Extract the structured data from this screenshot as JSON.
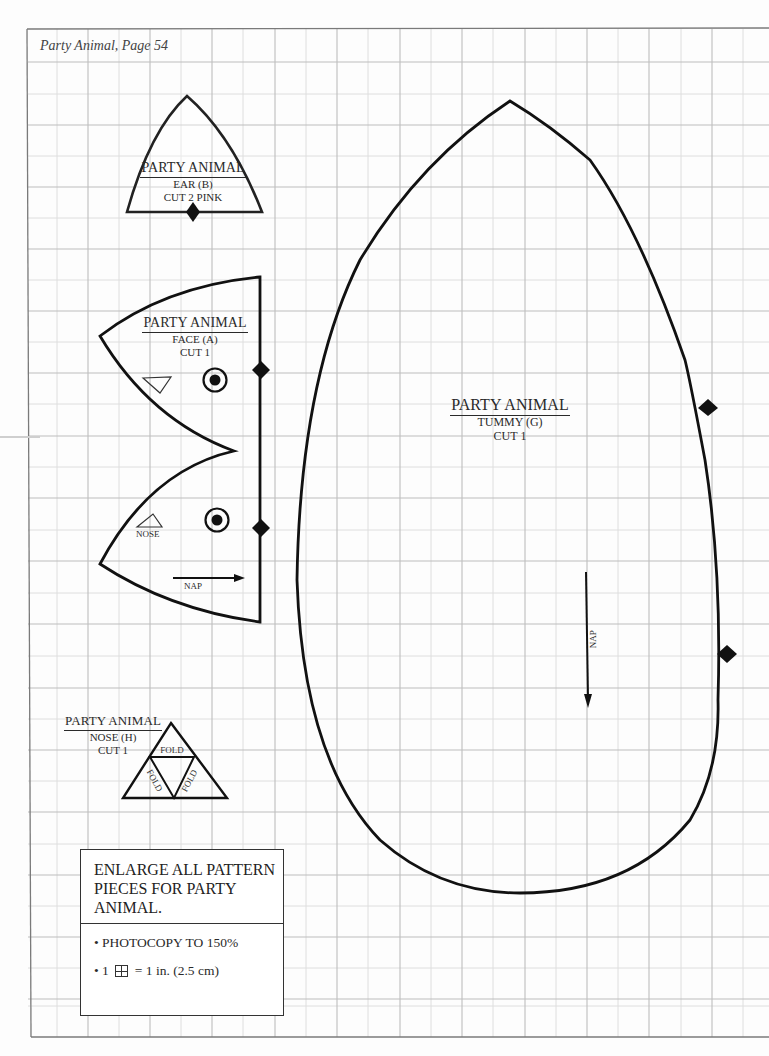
{
  "header": {
    "title": "Party Animal, Page 54"
  },
  "pieces": {
    "ear": {
      "title": "PARTY ANIMAL",
      "name": "EAR (B)",
      "cut": "CUT 2 PINK"
    },
    "face": {
      "title": "PARTY ANIMAL",
      "name": "FACE (A)",
      "cut": "CUT 1",
      "nose_label": "NOSE",
      "nap_label": "NAP"
    },
    "tummy": {
      "title": "PARTY ANIMAL",
      "name": "TUMMY (G)",
      "cut": "CUT 1",
      "nap_label": "NAP"
    },
    "nose": {
      "title": "PARTY ANIMAL",
      "name": "NOSE (H)",
      "cut": "CUT 1",
      "fold_label": "FOLD"
    }
  },
  "instructions": {
    "heading": "ENLARGE ALL PATTERN PIECES FOR PARTY ANIMAL.",
    "bullet1": "• PHOTOCOPY TO 150%",
    "bullet2_prefix": "• 1",
    "bullet2_suffix": "= 1 in. (2.5 cm)"
  },
  "colors": {
    "grid_major": "#b9b9b9",
    "grid_minor": "#dcdcdc",
    "outline": "#111111"
  }
}
